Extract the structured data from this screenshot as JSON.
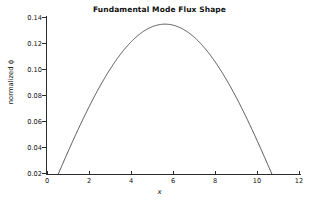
{
  "chart_data": {
    "type": "line",
    "title": "Fundamental Mode Flux Shape",
    "xlabel": "x",
    "ylabel": "normalized ϕ",
    "xlim": [
      0,
      12
    ],
    "ylim": [
      0.02,
      0.14
    ],
    "xticks": [
      "0",
      "2",
      "4",
      "6",
      "8",
      "10",
      "12"
    ],
    "xtick_values": [
      0,
      2,
      4,
      6,
      8,
      10,
      12
    ],
    "yticks": [
      "0.02",
      "0.04",
      "0.06",
      "0.08",
      "0.10",
      "0.12",
      "0.14"
    ],
    "ytick_values": [
      0.02,
      0.04,
      0.06,
      0.08,
      0.1,
      0.12,
      0.14
    ],
    "grid": false,
    "legend": false,
    "line_color": "#3a3a3a",
    "series": [
      {
        "name": "normalized flux",
        "x": [
          0.0,
          0.25,
          0.5,
          0.75,
          1.0,
          1.25,
          1.5,
          1.75,
          2.0,
          2.25,
          2.5,
          2.75,
          3.0,
          3.25,
          3.5,
          3.75,
          4.0,
          4.25,
          4.5,
          4.75,
          5.0,
          5.25,
          5.5,
          5.75,
          6.0,
          6.25,
          6.5,
          6.75,
          7.0,
          7.25,
          7.5,
          7.75,
          8.0,
          8.25,
          8.5,
          8.75,
          9.0,
          9.25,
          9.5,
          9.75,
          10.0,
          10.25,
          10.5,
          10.75,
          11.0,
          11.2
        ],
        "y": [
          0.0,
          0.0075,
          0.015,
          0.0224,
          0.0297,
          0.0369,
          0.0439,
          0.0508,
          0.0575,
          0.0639,
          0.0701,
          0.076,
          0.0816,
          0.0869,
          0.0918,
          0.0964,
          0.1006,
          0.1044,
          0.1078,
          0.1107,
          0.1133,
          0.1153,
          0.117,
          0.1181,
          0.1188,
          0.119,
          0.1188,
          0.118,
          0.1168,
          0.1151,
          0.1129,
          0.1102,
          0.1071,
          0.1035,
          0.0994,
          0.0949,
          0.0899,
          0.0845,
          0.0787,
          0.0725,
          0.0659,
          0.0589,
          0.0516,
          0.0439,
          0.0359,
          0.0292
        ],
        "peak_x": 5.6,
        "peak_y": 0.1338,
        "zero_crossing_x": 11.2
      }
    ],
    "annotations": []
  },
  "figure": {
    "background_color": "#ffffff",
    "axis_color": "#2b2b2b"
  }
}
